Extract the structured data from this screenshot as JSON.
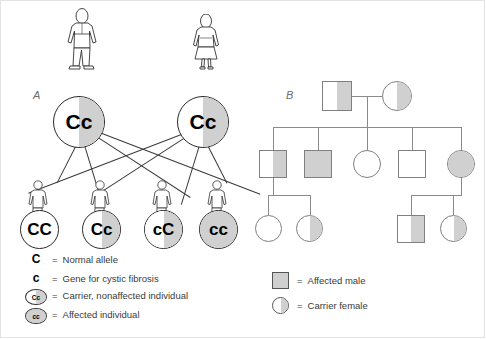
{
  "panelA": {
    "label": "A",
    "parents": [
      {
        "genotype": "Cc",
        "allele1": "C",
        "allele2": "c",
        "figure": "male-figure",
        "shading": "half"
      },
      {
        "genotype": "Cc",
        "allele1": "C",
        "allele2": "c",
        "figure": "female-figure",
        "shading": "half"
      }
    ],
    "offspring": [
      {
        "genotype": "CC",
        "allele1": "C",
        "allele2": "C",
        "shading": "none"
      },
      {
        "genotype": "Cc",
        "allele1": "C",
        "allele2": "c",
        "shading": "half"
      },
      {
        "genotype": "cC",
        "allele1": "c",
        "allele2": "C",
        "shading": "half"
      },
      {
        "genotype": "cc",
        "allele1": "c",
        "allele2": "c",
        "shading": "full"
      }
    ],
    "legend": [
      {
        "symbol": "C",
        "type": "allele",
        "equals": "=",
        "text": "Normal allele"
      },
      {
        "symbol": "c",
        "type": "allele",
        "equals": "=",
        "text": "Gene for cystic fibrosis"
      },
      {
        "symbol": "Cc",
        "type": "circle-half",
        "equals": "=",
        "text": "Carrier, nonaffected individual"
      },
      {
        "symbol": "cc",
        "type": "circle-full",
        "equals": "=",
        "text": "Affected individual"
      }
    ]
  },
  "panelB": {
    "label": "B",
    "generation1": [
      {
        "sex": "male",
        "shading": "half"
      },
      {
        "sex": "female",
        "shading": "half"
      }
    ],
    "generation2": [
      {
        "sex": "male",
        "shading": "half"
      },
      {
        "sex": "male",
        "shading": "full"
      },
      {
        "sex": "female",
        "shading": "none"
      },
      {
        "sex": "male",
        "shading": "none"
      },
      {
        "sex": "female",
        "shading": "full"
      }
    ],
    "generation3": [
      {
        "sex": "female",
        "shading": "none"
      },
      {
        "sex": "female",
        "shading": "half"
      },
      {
        "sex": "male",
        "shading": "half"
      },
      {
        "sex": "female",
        "shading": "half"
      }
    ],
    "legend": [
      {
        "type": "square-full",
        "equals": "=",
        "text": "Affected male"
      },
      {
        "type": "circle-half",
        "equals": "=",
        "text": "Carrier female"
      }
    ]
  },
  "colors": {
    "shade": "#d0d0d0",
    "outline_dark": "#2a2a2a",
    "outline_gray": "#808080",
    "text": "#3a3a3a",
    "frame": "#e3e3e3"
  }
}
